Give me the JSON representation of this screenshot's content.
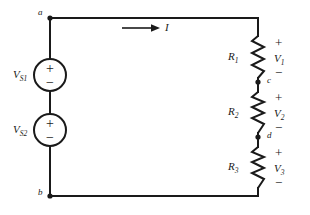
{
  "figure": {
    "type": "circuit-schematic"
  },
  "colors": {
    "wire": "#1a1a1a",
    "background": "#ffffff",
    "text": "#1a1a1a"
  },
  "nodes": [
    {
      "id": "a",
      "label": "a",
      "x": 50,
      "y": 18
    },
    {
      "id": "b",
      "label": "b",
      "x": 50,
      "y": 196
    },
    {
      "id": "c",
      "label": "c",
      "x": 258,
      "y": 82
    },
    {
      "id": "d",
      "label": "d",
      "x": 258,
      "y": 137
    }
  ],
  "sources": [
    {
      "id": "vs1",
      "label": "V",
      "subscript": "S1",
      "plus": "+",
      "minus": "−",
      "cx": 50,
      "cy": 75,
      "r": 16
    },
    {
      "id": "vs2",
      "label": "V",
      "subscript": "S2",
      "plus": "+",
      "minus": "−",
      "cx": 50,
      "cy": 130,
      "r": 16
    }
  ],
  "resistors": [
    {
      "id": "r1",
      "label": "R",
      "subscript": "1",
      "voltage_label": "V",
      "voltage_subscript": "1",
      "plus": "+",
      "minus": "−",
      "x": 258,
      "y_top": 36,
      "y_bottom": 78
    },
    {
      "id": "r2",
      "label": "R",
      "subscript": "2",
      "voltage_label": "V",
      "voltage_subscript": "2",
      "plus": "+",
      "minus": "−",
      "x": 258,
      "y_top": 92,
      "y_bottom": 133
    },
    {
      "id": "r3",
      "label": "R",
      "subscript": "3",
      "voltage_label": "V",
      "voltage_subscript": "3",
      "plus": "+",
      "minus": "−",
      "x": 258,
      "y_top": 147,
      "y_bottom": 188
    }
  ],
  "current": {
    "label": "I",
    "arrow_x_start": 122,
    "arrow_x_end": 156,
    "arrow_y": 28
  }
}
